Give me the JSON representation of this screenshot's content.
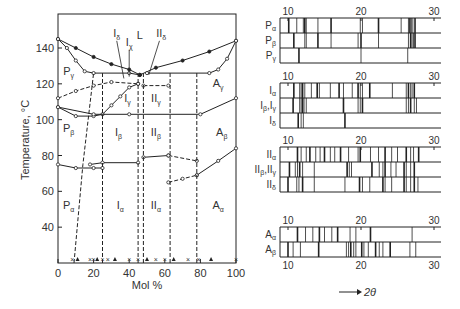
{
  "chart_data": [
    {
      "type": "scatter",
      "title": "Phase diagram",
      "xlabel": "Mol %",
      "ylabel": "Temperature, °C",
      "xlim": [
        0,
        100
      ],
      "ylim": [
        20,
        160
      ],
      "x_ticks": [
        "0",
        "20",
        "40",
        "60",
        "80",
        "100"
      ],
      "y_ticks": [
        "40",
        "60",
        "80",
        "100",
        "120",
        "140"
      ],
      "grid": false,
      "region_labels": [
        {
          "text": "L",
          "x": 46,
          "y": 145
        },
        {
          "text": "Iδ",
          "x": 33,
          "y": 146
        },
        {
          "text": "Iχ",
          "x": 40,
          "y": 141
        },
        {
          "text": "IIδ",
          "x": 58,
          "y": 146
        },
        {
          "text": "Pγ",
          "x": 6,
          "y": 125
        },
        {
          "text": "Iγ",
          "x": 39,
          "y": 110
        },
        {
          "text": "IIγ",
          "x": 55,
          "y": 110
        },
        {
          "text": "Aγ",
          "x": 90,
          "y": 118
        },
        {
          "text": "Pβ",
          "x": 6,
          "y": 93
        },
        {
          "text": "Iβ",
          "x": 34,
          "y": 91
        },
        {
          "text": "IIβ",
          "x": 55,
          "y": 91
        },
        {
          "text": "Aβ",
          "x": 92,
          "y": 91
        },
        {
          "text": "Pα",
          "x": 6,
          "y": 50
        },
        {
          "text": "Iα",
          "x": 35,
          "y": 50
        },
        {
          "text": "IIα",
          "x": 55,
          "y": 50
        },
        {
          "text": "Aα",
          "x": 90,
          "y": 50
        }
      ],
      "series": [
        {
          "name": "liquidus-left",
          "style": "solid",
          "points": [
            [
              0,
              145
            ],
            [
              10,
              140
            ],
            [
              20,
              135
            ],
            [
              30,
              131
            ],
            [
              40,
              128
            ],
            [
              46,
              125
            ]
          ]
        },
        {
          "name": "solidus-left",
          "style": "solid",
          "points": [
            [
              0,
              145
            ],
            [
              5,
              140
            ],
            [
              10,
              133
            ],
            [
              15,
              127
            ],
            [
              20,
              126
            ],
            [
              40,
              126
            ],
            [
              46,
              125
            ]
          ]
        },
        {
          "name": "liquidus-right",
          "style": "solid",
          "points": [
            [
              46,
              125
            ],
            [
              55,
              129
            ],
            [
              70,
              133
            ],
            [
              85,
              138
            ],
            [
              100,
              144
            ]
          ]
        },
        {
          "name": "solidus-right",
          "style": "solid",
          "points": [
            [
              50,
              126
            ],
            [
              85,
              126
            ],
            [
              90,
              128
            ],
            [
              95,
              134
            ],
            [
              100,
              144
            ]
          ]
        },
        {
          "name": "gamma-boundary-left",
          "style": "dashed",
          "points": [
            [
              0,
              112
            ],
            [
              10,
              116
            ],
            [
              20,
              119
            ],
            [
              30,
              121
            ],
            [
              45,
              120
            ]
          ]
        },
        {
          "name": "gamma-beta-I",
          "style": "solid",
          "points": [
            [
              0,
              107
            ],
            [
              10,
              102
            ],
            [
              20,
              102
            ],
            [
              25,
              103
            ],
            [
              30,
              108
            ],
            [
              35,
              113
            ],
            [
              40,
              118
            ],
            [
              45,
              120
            ]
          ]
        },
        {
          "name": "gamma-beta-line",
          "style": "solid",
          "points": [
            [
              0,
              107
            ],
            [
              20,
              103
            ],
            [
              40,
              103
            ],
            [
              80,
              103
            ],
            [
              100,
              112
            ]
          ]
        },
        {
          "name": "gamma-boundary-II",
          "style": "dashed",
          "points": [
            [
              48,
              119
            ],
            [
              62,
              119
            ]
          ]
        },
        {
          "name": "beta-alpha-left",
          "style": "solid",
          "points": [
            [
              0,
              75
            ],
            [
              10,
              73
            ],
            [
              20,
              73
            ],
            [
              25,
              73
            ]
          ]
        },
        {
          "name": "beta-alpha-I",
          "style": "solid",
          "points": [
            [
              18,
              75
            ],
            [
              25,
              76
            ],
            [
              45,
              76
            ]
          ]
        },
        {
          "name": "beta-alpha-II",
          "style": "solid",
          "points": [
            [
              48,
              79
            ],
            [
              62,
              80
            ]
          ]
        },
        {
          "name": "beta-alpha-II-dashed",
          "style": "dashed",
          "points": [
            [
              62,
              80
            ],
            [
              78,
              77
            ]
          ]
        },
        {
          "name": "beta-alpha-A",
          "style": "dashed",
          "points": [
            [
              62,
              65
            ],
            [
              70,
              67
            ],
            [
              78,
              69
            ]
          ]
        },
        {
          "name": "beta-alpha-A-solid",
          "style": "solid",
          "points": [
            [
              78,
              69
            ],
            [
              90,
              77
            ],
            [
              100,
              84
            ]
          ]
        },
        {
          "name": "vertical-P-I-left",
          "style": "dashed",
          "points": [
            [
              9,
              20
            ],
            [
              14,
              75
            ],
            [
              20,
              126
            ]
          ]
        },
        {
          "name": "vertical-I-left",
          "style": "dashed",
          "points": [
            [
              25,
              20
            ],
            [
              25,
              126
            ]
          ]
        },
        {
          "name": "vertical-I-right",
          "style": "dashed",
          "points": [
            [
              45,
              20
            ],
            [
              45,
              125
            ]
          ]
        },
        {
          "name": "vertical-II-left",
          "style": "dashed",
          "points": [
            [
              48,
              20
            ],
            [
              48,
              126
            ]
          ]
        },
        {
          "name": "vertical-II-right",
          "style": "dashed",
          "points": [
            [
              63,
              20
            ],
            [
              63,
              126
            ]
          ]
        },
        {
          "name": "vertical-A-left",
          "style": "dashed",
          "points": [
            [
              78,
              20
            ],
            [
              78,
              126
            ]
          ]
        }
      ]
    },
    {
      "type": "bar",
      "title": "Powder X-ray diffraction patterns",
      "xlabel": "2θ",
      "x_axis_arrow": "→ 2θ",
      "xlim": [
        9,
        32
      ],
      "x_ticks": [
        "10",
        "20",
        "30"
      ],
      "groups": [
        {
          "name": "P",
          "rows": [
            {
              "label": "Pα",
              "peaks": [
                10.1,
                11.2,
                12.1,
                12.3,
                12.5,
                14.1,
                15.9,
                19.9,
                20.2,
                22.4,
                25.5,
                26.5,
                26.7,
                26.9,
                27.1,
                27.4
              ]
            },
            {
              "label": "Pβ",
              "peaks": [
                10.8,
                12.3,
                12.5,
                14.1,
                15.9,
                19.6,
                20.0,
                22.4,
                26.5,
                26.8,
                27.0,
                27.2,
                27.4
              ]
            },
            {
              "label": "Pγ",
              "peaks": [
                11.5,
                20.0,
                26.4
              ]
            }
          ]
        },
        {
          "name": "I",
          "rows": [
            {
              "label": "Iα",
              "peaks": [
                10.8,
                11.6,
                11.8,
                12.0,
                12.3,
                13.2,
                14.0,
                14.3,
                15.8,
                17.0,
                17.6,
                18.8,
                19.6,
                19.9,
                20.2,
                21.2,
                24.3,
                26.2,
                26.5,
                26.8,
                27.0,
                27.3
              ]
            },
            {
              "label": "Iβ,Iγ",
              "peaks": [
                10.7,
                11.6,
                11.8,
                12.0,
                12.2,
                12.5,
                17.6,
                19.6,
                19.9,
                20.2,
                26.2,
                26.5,
                26.8,
                27.3,
                27.6
              ]
            },
            {
              "label": "Iδ",
              "peaks": [
                11.4,
                11.8,
                12.1,
                17.8
              ]
            }
          ]
        },
        {
          "name": "II",
          "rows": [
            {
              "label": "IIα",
              "peaks": [
                11.3,
                11.8,
                12.5,
                13.0,
                13.8,
                14.4,
                15.0,
                15.8,
                16.4,
                17.2,
                18.3,
                19.6,
                19.9,
                21.3,
                22.4,
                23.3,
                24.2,
                25.0,
                26.2,
                26.8,
                27.2,
                27.9
              ]
            },
            {
              "label": "IIβ,IIγ",
              "peaks": [
                10.2,
                11.0,
                11.3,
                11.6,
                12.0,
                13.6,
                18.1,
                18.4,
                18.7,
                21.5,
                22.5,
                23.0,
                23.3,
                24.1,
                24.8,
                25.9,
                26.2,
                26.8,
                27.3
              ]
            },
            {
              "label": "IIδ",
              "peaks": [
                10.0,
                11.2,
                11.5,
                12.0,
                13.6,
                17.8,
                19.8,
                20.2,
                21.2,
                23.0,
                23.3,
                24.2,
                25.9,
                26.2,
                26.8,
                27.3,
                27.8
              ]
            }
          ]
        },
        {
          "name": "A",
          "rows": [
            {
              "label": "Aα",
              "peaks": [
                11.3,
                12.4,
                13.4,
                14.3,
                15.0,
                16.0,
                16.8,
                18.5,
                19.3,
                21.3,
                27.0
              ]
            },
            {
              "label": "Aβ",
              "peaks": [
                10.0,
                10.7,
                11.7,
                14.2,
                18.0,
                18.3,
                18.6,
                19.0,
                19.3,
                20.1,
                20.4,
                21.0,
                22.0,
                22.5,
                23.0,
                24.0,
                26.7,
                27.5
              ]
            }
          ]
        }
      ]
    }
  ],
  "left_chart": {
    "ylabel": "Temperature, °C",
    "xlabel": "Mol %",
    "y_ticks": [
      "40",
      "60",
      "80",
      "100",
      "120",
      "140"
    ],
    "x_ticks": [
      "0",
      "20",
      "40",
      "60",
      "80",
      "100"
    ]
  },
  "right_chart": {
    "axis_label": "2θ",
    "tick_10": "10",
    "tick_20": "20",
    "tick_30": "30"
  }
}
